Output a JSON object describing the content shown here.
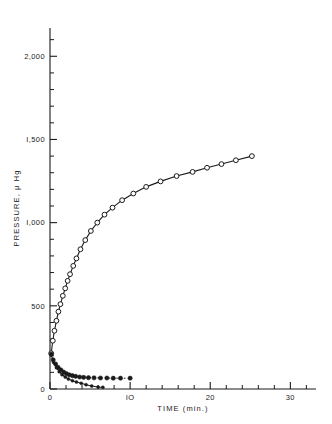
{
  "chart_data": {
    "type": "line",
    "title": "",
    "xlabel": "TIME (min.)",
    "ylabel": "PRESSURE, μ Hg",
    "xlim": [
      0,
      33
    ],
    "ylim": [
      0,
      2200
    ],
    "grid": false,
    "legend_position": "none",
    "x_ticks_major": [
      0,
      10,
      20,
      30
    ],
    "x_tick_labels": [
      "0",
      "IO",
      "20",
      "30"
    ],
    "x_tick_minor_step": 2,
    "y_ticks_major": [
      0,
      500,
      1000,
      1500,
      2000
    ],
    "y_tick_labels": [
      "0",
      "500",
      "I,000",
      "I,500",
      "2,000"
    ],
    "y_tick_minor_step": 100,
    "series": [
      {
        "name": "rising-pressure",
        "marker": "open-circle",
        "line": "solid",
        "x": [
          0.15,
          0.35,
          0.55,
          0.8,
          1.05,
          1.3,
          1.6,
          1.9,
          2.2,
          2.5,
          2.9,
          3.3,
          3.8,
          4.4,
          5.1,
          5.9,
          6.8,
          7.8,
          9.0,
          10.4,
          12.0,
          13.8,
          15.8,
          17.8,
          19.6,
          21.4,
          23.2,
          25.2
        ],
        "y": [
          215,
          290,
          350,
          410,
          465,
          510,
          560,
          605,
          650,
          690,
          740,
          785,
          840,
          895,
          950,
          1000,
          1048,
          1090,
          1135,
          1175,
          1215,
          1248,
          1280,
          1305,
          1330,
          1352,
          1375,
          1400
        ]
      },
      {
        "name": "decaying-pressure",
        "marker": "filled-circle",
        "line": "dashed",
        "x": [
          0.15,
          0.4,
          0.7,
          1.0,
          1.35,
          1.7,
          2.05,
          2.4,
          2.8,
          3.2,
          3.7,
          4.2,
          4.8,
          5.5,
          6.3,
          7.1,
          7.9,
          8.8,
          10.0
        ],
        "y": [
          210,
          175,
          150,
          130,
          115,
          102,
          92,
          85,
          80,
          76,
          72,
          70,
          68,
          67,
          66,
          66,
          65,
          65,
          65
        ]
      },
      {
        "name": "decaying-pressure-lower",
        "marker": "filled-circle-small",
        "line": "solid",
        "x": [
          0.15,
          0.45,
          0.8,
          1.15,
          1.5,
          1.9,
          2.3,
          2.8,
          3.3,
          3.9,
          4.5,
          5.2,
          6.0,
          6.6
        ],
        "y": [
          205,
          160,
          128,
          104,
          86,
          72,
          60,
          50,
          42,
          34,
          26,
          18,
          12,
          10
        ]
      }
    ]
  },
  "axes": {
    "x_axis_name": "time-axis",
    "y_axis_name": "pressure-axis"
  }
}
